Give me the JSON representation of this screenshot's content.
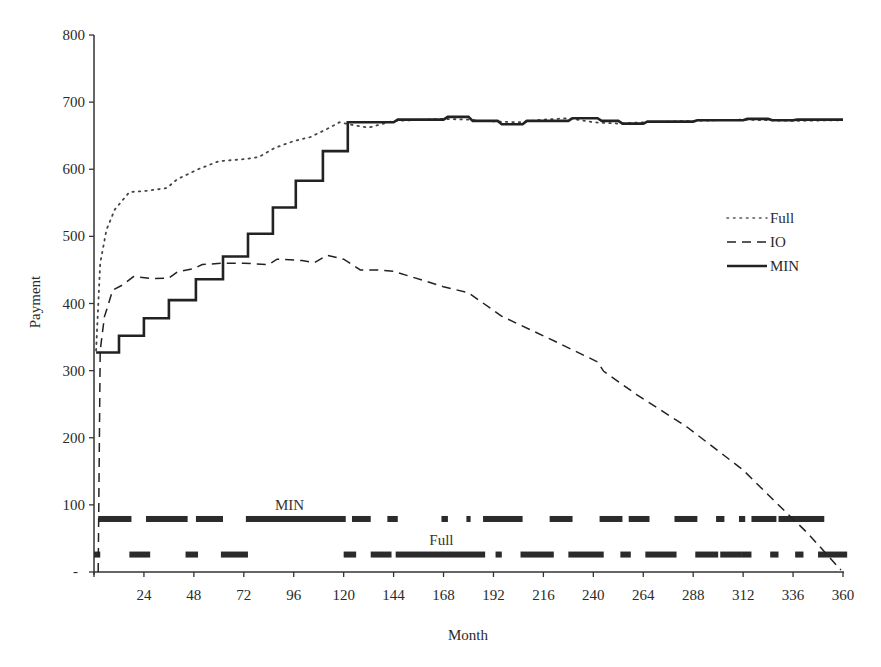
{
  "chart_data": {
    "type": "line",
    "title": "",
    "xlabel": "Month",
    "ylabel": "Payment",
    "xlim": [
      0,
      360
    ],
    "ylim": [
      0,
      800
    ],
    "grid": false,
    "legend_position": "right-center",
    "x_ticks": [
      24,
      48,
      72,
      96,
      120,
      144,
      168,
      192,
      216,
      240,
      264,
      288,
      312,
      336,
      360
    ],
    "y_ticks": [
      100,
      200,
      300,
      400,
      500,
      600,
      700,
      800
    ],
    "y_zero_label": "-",
    "legend": [
      {
        "label": "Full",
        "style": "dotted"
      },
      {
        "label": "IO",
        "style": "dashed"
      },
      {
        "label": "MIN",
        "style": "solid"
      }
    ],
    "series": [
      {
        "name": "Full",
        "style": "dotted",
        "points": [
          [
            1,
            330
          ],
          [
            3,
            460
          ],
          [
            6,
            510
          ],
          [
            10,
            540
          ],
          [
            17,
            566
          ],
          [
            26,
            568
          ],
          [
            35,
            572
          ],
          [
            40,
            585
          ],
          [
            50,
            600
          ],
          [
            60,
            612
          ],
          [
            72,
            615
          ],
          [
            79,
            618
          ],
          [
            87,
            632
          ],
          [
            96,
            642
          ],
          [
            104,
            648
          ],
          [
            112,
            660
          ],
          [
            118,
            670
          ],
          [
            124,
            666
          ],
          [
            132,
            662
          ],
          [
            144,
            672
          ],
          [
            168,
            675
          ],
          [
            180,
            674
          ],
          [
            186,
            672
          ],
          [
            204,
            670
          ],
          [
            216,
            674
          ],
          [
            228,
            676
          ],
          [
            240,
            670
          ],
          [
            252,
            668
          ],
          [
            264,
            670
          ],
          [
            288,
            672
          ],
          [
            312,
            674
          ],
          [
            336,
            672
          ],
          [
            360,
            673
          ]
        ]
      },
      {
        "name": "IO",
        "style": "dashed",
        "points": [
          [
            2,
            0
          ],
          [
            3,
            330
          ],
          [
            5,
            380
          ],
          [
            9,
            420
          ],
          [
            14,
            428
          ],
          [
            19,
            440
          ],
          [
            28,
            437
          ],
          [
            36,
            438
          ],
          [
            40,
            447
          ],
          [
            48,
            452
          ],
          [
            52,
            458
          ],
          [
            62,
            460
          ],
          [
            72,
            460
          ],
          [
            84,
            458
          ],
          [
            88,
            466
          ],
          [
            100,
            464
          ],
          [
            106,
            461
          ],
          [
            112,
            472
          ],
          [
            120,
            466
          ],
          [
            128,
            450
          ],
          [
            136,
            450
          ],
          [
            144,
            448
          ],
          [
            168,
            425
          ],
          [
            180,
            416
          ],
          [
            196,
            381
          ],
          [
            222,
            343
          ],
          [
            242,
            313
          ],
          [
            245,
            299
          ],
          [
            261,
            264
          ],
          [
            285,
            216
          ],
          [
            312,
            152
          ],
          [
            328,
            103
          ],
          [
            343,
            58
          ],
          [
            359,
            3
          ]
        ]
      },
      {
        "name": "MIN",
        "style": "solid-step",
        "points": [
          [
            1,
            327
          ],
          [
            12,
            327
          ],
          [
            12,
            352
          ],
          [
            24,
            352
          ],
          [
            24,
            378
          ],
          [
            36,
            378
          ],
          [
            36,
            405
          ],
          [
            49,
            405
          ],
          [
            49,
            436
          ],
          [
            62,
            436
          ],
          [
            62,
            470
          ],
          [
            74,
            470
          ],
          [
            74,
            504
          ],
          [
            86,
            504
          ],
          [
            86,
            543
          ],
          [
            97,
            543
          ],
          [
            97,
            583
          ],
          [
            110,
            583
          ],
          [
            110,
            627
          ],
          [
            122,
            627
          ],
          [
            122,
            670
          ],
          [
            144,
            670
          ],
          [
            146,
            674
          ],
          [
            168,
            674
          ],
          [
            170,
            678
          ],
          [
            180,
            678
          ],
          [
            182,
            672
          ],
          [
            194,
            672
          ],
          [
            196,
            667
          ],
          [
            206,
            667
          ],
          [
            208,
            672
          ],
          [
            228,
            672
          ],
          [
            230,
            676
          ],
          [
            242,
            676
          ],
          [
            244,
            672
          ],
          [
            252,
            672
          ],
          [
            254,
            668
          ],
          [
            264,
            668
          ],
          [
            266,
            671
          ],
          [
            288,
            671
          ],
          [
            290,
            673
          ],
          [
            312,
            673
          ],
          [
            314,
            675
          ],
          [
            324,
            675
          ],
          [
            326,
            673
          ],
          [
            336,
            673
          ],
          [
            338,
            674
          ],
          [
            360,
            674
          ]
        ]
      }
    ],
    "regime_bars": [
      {
        "label": "MIN",
        "y_value": 79,
        "label_x_month": 94,
        "segments_month": [
          [
            2,
            18
          ],
          [
            25,
            45
          ],
          [
            49,
            62
          ],
          [
            73,
            121
          ],
          [
            124,
            133
          ],
          [
            141,
            146
          ],
          [
            167,
            170
          ],
          [
            168,
            170
          ],
          [
            179,
            181
          ],
          [
            187,
            206
          ],
          [
            219,
            230
          ],
          [
            243,
            254
          ],
          [
            257,
            267
          ],
          [
            279,
            290
          ],
          [
            299,
            303
          ],
          [
            310,
            313
          ],
          [
            316,
            328
          ],
          [
            329,
            351
          ]
        ]
      },
      {
        "label": "Full",
        "y_value": 26,
        "label_x_month": 167,
        "segments_month": [
          [
            0,
            3
          ],
          [
            17,
            27
          ],
          [
            44,
            50
          ],
          [
            61,
            74
          ],
          [
            120,
            126
          ],
          [
            133,
            143
          ],
          [
            145,
            188
          ],
          [
            193,
            196
          ],
          [
            205,
            221
          ],
          [
            228,
            245
          ],
          [
            253,
            258
          ],
          [
            265,
            280
          ],
          [
            289,
            300
          ],
          [
            301,
            311
          ],
          [
            311,
            316
          ],
          [
            325,
            329
          ],
          [
            337,
            341
          ],
          [
            348,
            362
          ]
        ]
      }
    ],
    "annotations": [
      {
        "text": "MIN",
        "x_month": 94,
        "y_value": 100
      },
      {
        "text": "Full",
        "x_month": 167,
        "y_value": 47
      }
    ]
  }
}
